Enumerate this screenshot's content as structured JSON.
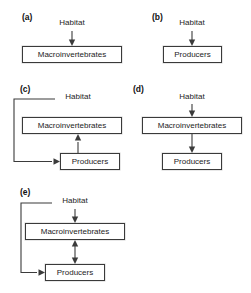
{
  "figure": {
    "background_color": "#ffffff",
    "line_color": "#3b3b3b",
    "box_border_color": "#3a3a3a",
    "text_color": "#1c1c1c"
  },
  "nodes": {
    "habitat": "Habitat",
    "macroinvertebrates": "Macroinvertebrates",
    "producers": "Producers"
  },
  "panels": [
    {
      "id": "a",
      "label": "(a)",
      "plain_text_node": "Habitat",
      "boxes": [
        "Macroinvertebrates"
      ],
      "arrows": [
        "Habitat -> Macroinvertebrates"
      ]
    },
    {
      "id": "b",
      "label": "(b)",
      "plain_text_node": "Habitat",
      "boxes": [
        "Producers"
      ],
      "arrows": [
        "Habitat -> Producers"
      ]
    },
    {
      "id": "c",
      "label": "(c)",
      "plain_text_node": "Habitat",
      "boxes": [
        "Macroinvertebrates",
        "Producers"
      ],
      "arrows": [
        "Habitat -> Producers (elbow, left routed)",
        "Producers -> Macroinvertebrates (up)"
      ]
    },
    {
      "id": "d",
      "label": "(d)",
      "plain_text_node": "Habitat",
      "boxes": [
        "Macroinvertebrates",
        "Producers"
      ],
      "arrows": [
        "Habitat -> Macroinvertebrates",
        "Macroinvertebrates -> Producers"
      ]
    },
    {
      "id": "e",
      "label": "(e)",
      "plain_text_node": "Habitat",
      "boxes": [
        "Macroinvertebrates",
        "Producers"
      ],
      "arrows": [
        "Habitat -> Producers (elbow, left routed)",
        "Habitat -> Macroinvertebrates",
        "Macroinvertebrates <-> Producers (bidirectional)"
      ]
    }
  ]
}
